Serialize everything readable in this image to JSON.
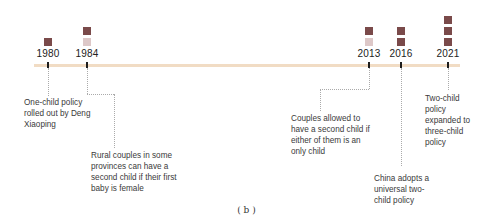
{
  "colors": {
    "timeline_bar": "#f1dcc4",
    "square_dark": "#7a4a4a",
    "square_light": "#ddc8c8",
    "tick": "#1e1e1e",
    "connector": "#aaaaaa"
  },
  "events": [
    {
      "year": "1980",
      "squares": [
        "dark"
      ],
      "note": "One-child policy rolled out by Deng Xiaoping"
    },
    {
      "year": "1984",
      "squares": [
        "dark",
        "light"
      ],
      "note": "Rural couples in some provinces can have a second child if their first baby is female"
    },
    {
      "year": "2013",
      "squares": [
        "dark",
        "light"
      ],
      "note": "Couples allowed to have a second child if either of them is an only child"
    },
    {
      "year": "2016",
      "squares": [
        "dark",
        "dark"
      ],
      "note": "China adopts a universal two-child policy"
    },
    {
      "year": "2021",
      "squares": [
        "dark",
        "dark",
        "dark"
      ],
      "note": "Two-child policy expanded to three-child policy"
    }
  ],
  "caption": "( b )"
}
